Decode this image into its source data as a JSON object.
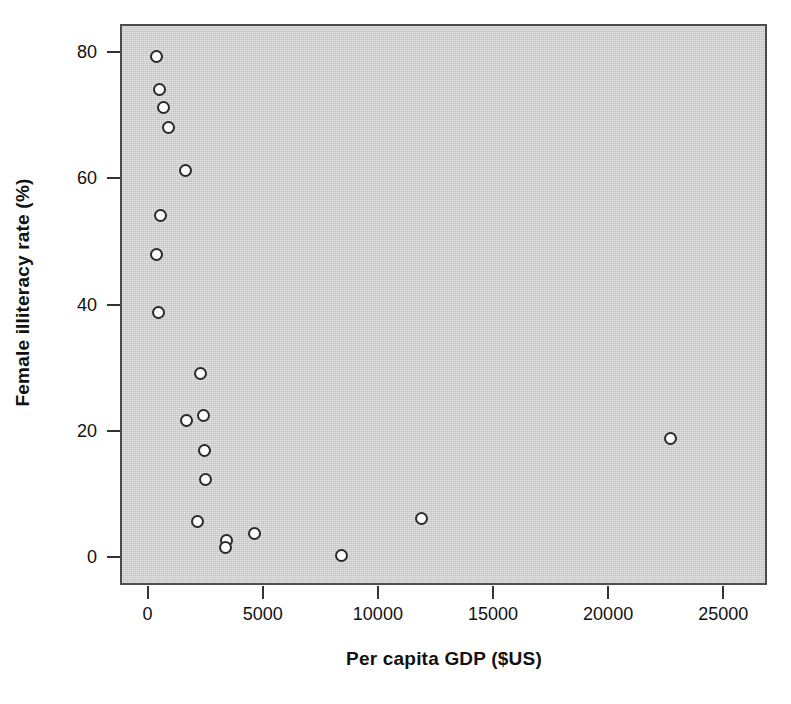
{
  "chart_data": {
    "type": "scatter",
    "title": "",
    "xlabel": "Per capita GDP ($US)",
    "ylabel": "Female illiteracy rate (%)",
    "xlim": [
      -1200,
      26900
    ],
    "ylim": [
      -4.5,
      84.5
    ],
    "xticks": [
      0,
      5000,
      10000,
      15000,
      20000,
      25000
    ],
    "xtick_labels": [
      "0",
      "5000",
      "10000",
      "15000",
      "20000",
      "25000"
    ],
    "yticks": [
      0,
      20,
      40,
      60,
      80
    ],
    "ytick_labels": [
      "0",
      "20",
      "40",
      "60",
      "80"
    ],
    "grid": false,
    "legend": null,
    "panel_color": "#d4d4d4",
    "marker": {
      "shape": "circle",
      "fill": "#fdfdfd",
      "edge": "#2a2a2a",
      "size_px": 13
    },
    "n_points": 22,
    "x": [
      300,
      440,
      610,
      800,
      1570,
      480,
      300,
      400,
      2190,
      1620,
      2320,
      2400,
      2440,
      2070,
      3320,
      3280,
      4560,
      8340,
      11810,
      22610,
      2380,
      1870
    ],
    "y": [
      79.6,
      74.4,
      71.6,
      68.4,
      61.6,
      54.5,
      48.3,
      39.1,
      29.4,
      21.9,
      22.7,
      17.1,
      12.5,
      5.9,
      2.9,
      1.7,
      4.0,
      0.5,
      6.3,
      19.0,
      12.5,
      21.9
    ],
    "points": [
      {
        "x": 300,
        "y": 79.6
      },
      {
        "x": 440,
        "y": 74.4
      },
      {
        "x": 610,
        "y": 71.6
      },
      {
        "x": 800,
        "y": 68.4
      },
      {
        "x": 1570,
        "y": 61.6
      },
      {
        "x": 480,
        "y": 54.5
      },
      {
        "x": 300,
        "y": 48.3
      },
      {
        "x": 400,
        "y": 39.1
      },
      {
        "x": 2190,
        "y": 29.4
      },
      {
        "x": 1620,
        "y": 21.9
      },
      {
        "x": 2320,
        "y": 22.7
      },
      {
        "x": 2400,
        "y": 17.1
      },
      {
        "x": 2440,
        "y": 12.5
      },
      {
        "x": 2070,
        "y": 5.9
      },
      {
        "x": 3320,
        "y": 2.9
      },
      {
        "x": 3280,
        "y": 1.7
      },
      {
        "x": 4560,
        "y": 4.0
      },
      {
        "x": 8340,
        "y": 0.5
      },
      {
        "x": 11810,
        "y": 6.3
      },
      {
        "x": 22610,
        "y": 19.0
      }
    ]
  }
}
